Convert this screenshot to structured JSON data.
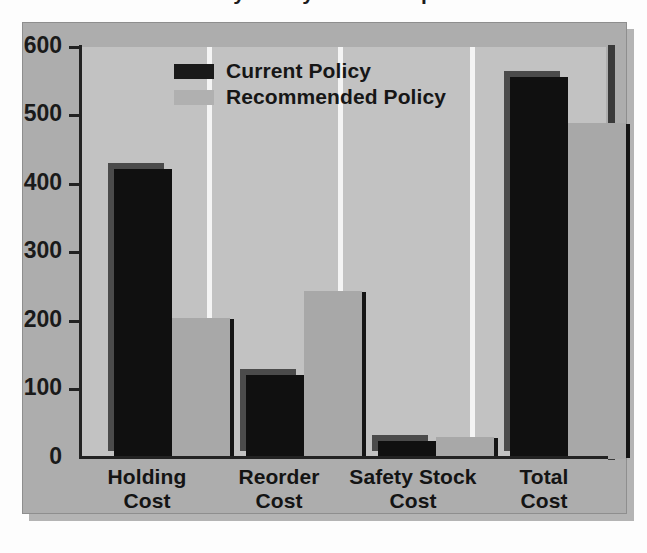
{
  "title": "Inventory Policy Cost Comparison",
  "legend": {
    "position": "top-center",
    "entries": [
      {
        "label": "Current Policy",
        "color": "#1a1a1a",
        "swatch": "legend-swatch-current"
      },
      {
        "label": "Recommended Policy",
        "color": "#b0b0b0",
        "swatch": "legend-swatch-recommended"
      }
    ]
  },
  "axes": {
    "y_ticks": [
      "0",
      "100",
      "200",
      "300",
      "400",
      "500",
      "600"
    ],
    "y_label": "",
    "x_label": ""
  },
  "categories": [
    {
      "line1": "Holding",
      "line2": "Cost"
    },
    {
      "line1": "Reorder",
      "line2": "Cost"
    },
    {
      "line1": "Safety Stock",
      "line2": "Cost"
    },
    {
      "line1": "Total",
      "line2": "Cost"
    }
  ],
  "chart_data": {
    "type": "bar",
    "title": "Inventory Policy Cost Comparison",
    "xlabel": "",
    "ylabel": "",
    "ylim": [
      0,
      600
    ],
    "ytick_step": 100,
    "grid": false,
    "legend_position": "top-center",
    "categories": [
      "Holding Cost",
      "Reorder Cost",
      "Safety Stock Cost",
      "Total Cost"
    ],
    "series": [
      {
        "name": "Current Policy",
        "color": "#101010",
        "values": [
          422,
          123,
          26,
          556
        ]
      },
      {
        "name": "Recommended Policy",
        "color": "#a8a8a8",
        "values": [
          206,
          244,
          32,
          489
        ]
      }
    ]
  },
  "colors": {
    "frame": "#adadad",
    "plot_background": "#c2c2c2",
    "separator": "#f4f4f4",
    "axis": "#222222",
    "current_policy": "#101010",
    "recommended_policy": "#a8a8a8"
  }
}
